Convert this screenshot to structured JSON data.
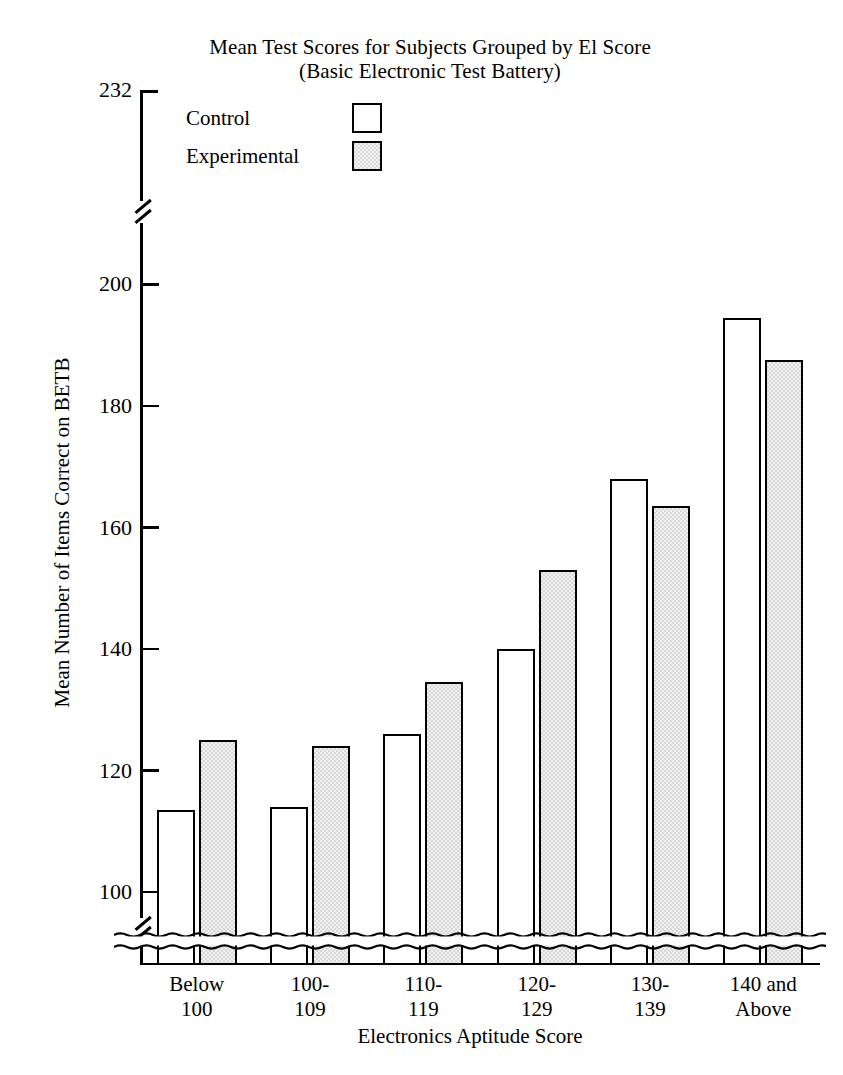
{
  "chart_data": {
    "type": "bar",
    "title": "Mean Test Scores for Subjects Grouped by El Score",
    "subtitle": "(Basic Electronic Test Battery)",
    "xlabel": "Electronics Aptitude Score",
    "ylabel": "Mean Number of Items Correct on BETB",
    "categories": [
      "Below\n100",
      "100-\n109",
      "110-\n119",
      "120-\n129",
      "130-\n139",
      "140 and\nAbove"
    ],
    "category_lines": [
      [
        "Below",
        "100"
      ],
      [
        "100-",
        "109"
      ],
      [
        "110-",
        "119"
      ],
      [
        "120-",
        "129"
      ],
      [
        "130-",
        "139"
      ],
      [
        "140 and",
        "Above"
      ]
    ],
    "series": [
      {
        "name": "Control",
        "values": [
          113.5,
          114,
          126,
          140,
          168,
          194.5
        ],
        "fill": "#ffffff"
      },
      {
        "name": "Experimental",
        "values": [
          125,
          124,
          134.5,
          153,
          163.5,
          187.5
        ],
        "fill": "#d8d8d8"
      }
    ],
    "ylim": [
      88,
      232
    ],
    "yticks": [
      100,
      120,
      140,
      160,
      180,
      200,
      232
    ],
    "ytick_labels": [
      "100",
      "120",
      "140",
      "160",
      "180",
      "200",
      "232"
    ],
    "axis_break": {
      "y_axis_breaks": [
        94,
        212
      ],
      "bars_break_at": 92,
      "note": "y-axis is broken below 100 and between 200 and 232; bars are drawn with a wavy break near the baseline"
    },
    "grid": false,
    "legend_position": "upper-left-inside"
  },
  "legend": {
    "entries": [
      {
        "label": "Control",
        "swatch": "open-square"
      },
      {
        "label": "Experimental",
        "swatch": "shaded-square"
      }
    ]
  },
  "colors": {
    "ink": "#000000",
    "background": "#ffffff",
    "experimental_fill": "#d8d8d8",
    "control_fill": "#ffffff"
  }
}
